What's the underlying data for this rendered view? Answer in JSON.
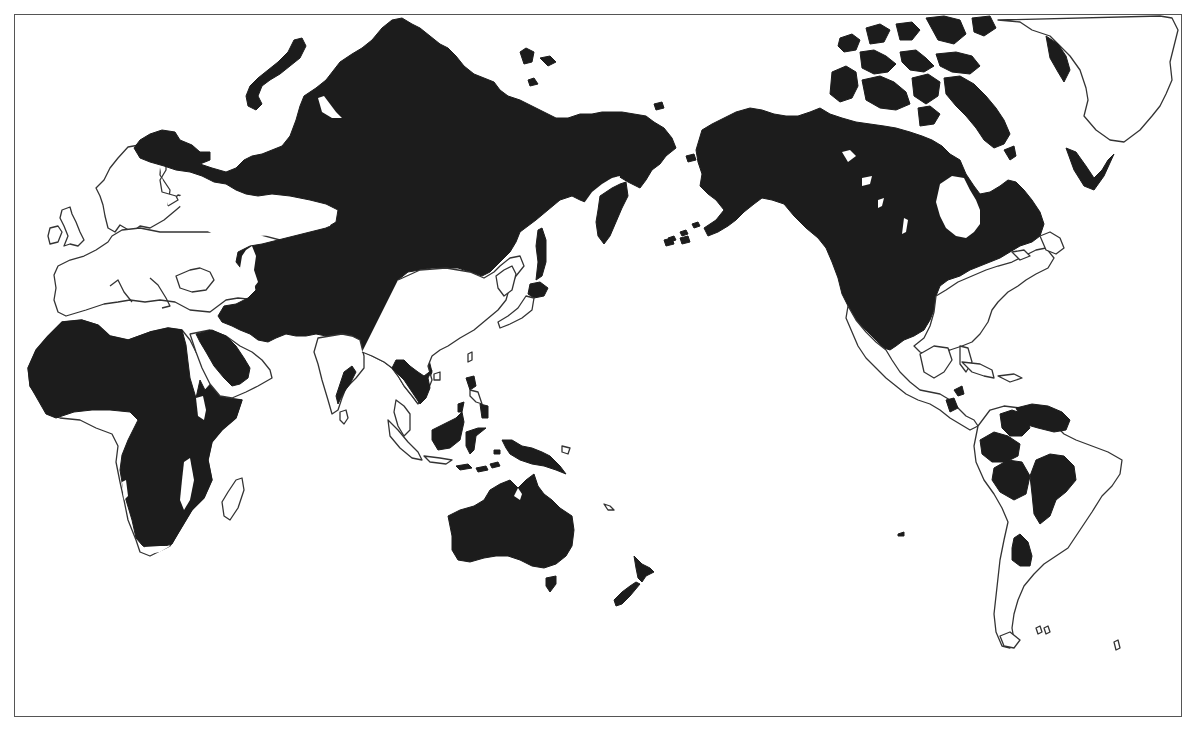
{
  "map": {
    "type": "world-distribution-map",
    "projection": "Pacific-centered world map",
    "frame": true,
    "legend": null,
    "title": null,
    "colors": {
      "present": "#1c1c1c",
      "absent": "#ffffff",
      "coastline": "#333333",
      "frame": "#555555"
    },
    "regions": [
      {
        "id": "africa",
        "name": "Africa",
        "status": "present",
        "note": "mostly shaded; gaps in West African coast, Horn region, East African lakes, south tip"
      },
      {
        "id": "arabia",
        "name": "Arabian Peninsula",
        "status": "present",
        "note": "central Arabia shaded"
      },
      {
        "id": "europe",
        "name": "Europe",
        "status": "absent"
      },
      {
        "id": "scandinavia",
        "name": "Scandinavia",
        "status": "partial",
        "note": "northern tip shaded"
      },
      {
        "id": "northern-eurasia",
        "name": "Russia / Siberia / Central Asia",
        "status": "present"
      },
      {
        "id": "novaya-zemlya",
        "name": "Novaya Zemlya",
        "status": "present"
      },
      {
        "id": "india",
        "name": "Indian subcontinent",
        "status": "absent",
        "note": "small shaded strip on east coast"
      },
      {
        "id": "china-east",
        "name": "Eastern China",
        "status": "absent"
      },
      {
        "id": "indochina",
        "name": "Indochina",
        "status": "present"
      },
      {
        "id": "korea-japan",
        "name": "Korea / Japan",
        "status": "absent",
        "note": "Hokkaido and Sakhalin shaded"
      },
      {
        "id": "kamchatka",
        "name": "Kamchatka",
        "status": "present"
      },
      {
        "id": "maritime-se-asia",
        "name": "Borneo / Sulawesi / Philippines",
        "status": "present"
      },
      {
        "id": "sumatra-java",
        "name": "Sumatra / Java",
        "status": "absent"
      },
      {
        "id": "new-guinea",
        "name": "New Guinea",
        "status": "present"
      },
      {
        "id": "australia",
        "name": "Australia",
        "status": "present"
      },
      {
        "id": "tasmania",
        "name": "Tasmania",
        "status": "present"
      },
      {
        "id": "new-zealand",
        "name": "New Zealand",
        "status": "present"
      },
      {
        "id": "madagascar",
        "name": "Madagascar",
        "status": "absent"
      },
      {
        "id": "alaska-canada",
        "name": "Alaska / Canada / Western USA",
        "status": "present"
      },
      {
        "id": "arctic-archipelago",
        "name": "Canadian Arctic Archipelago",
        "status": "present"
      },
      {
        "id": "hudson-bay",
        "name": "Hudson Bay",
        "status": "water"
      },
      {
        "id": "eastern-usa",
        "name": "Eastern USA / Maritimes",
        "status": "absent"
      },
      {
        "id": "mexico",
        "name": "Mexico / Central America",
        "status": "partial",
        "note": "northern Mexico shaded, small patches in Central America"
      },
      {
        "id": "greenland",
        "name": "Greenland",
        "status": "partial",
        "note": "west and south coastal strips shaded"
      },
      {
        "id": "south-america",
        "name": "South America",
        "status": "partial",
        "note": "five separate shaded patches in north, Amazon, Brazil highlands, Chaco"
      }
    ]
  }
}
